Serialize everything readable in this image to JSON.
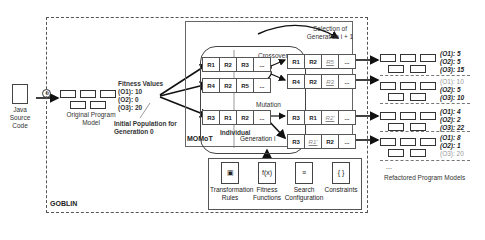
{
  "input": {
    "label": "Java Source Code",
    "icon": "document-icon"
  },
  "parser_icon": "gear-icon",
  "original_model": {
    "label": "Original Program Model"
  },
  "fitness": {
    "title": "Fitness Values",
    "values": [
      "(O1): 10",
      "(O2): 0",
      "(O3): 20"
    ]
  },
  "initial_population": "Initial Population for Generation 0",
  "containers": {
    "goblin": "GOBLIN",
    "momot": "MOMoT",
    "generation": "Generation i"
  },
  "operators": {
    "crossover": "Crossover",
    "mutation": "Mutation",
    "selection": "Selection of Generation i + 1"
  },
  "individual_label": "Individual",
  "parents": [
    [
      "R1",
      "R2",
      "R3",
      "..."
    ],
    [
      "R4",
      "R2",
      "R5",
      "..."
    ],
    [
      "R3",
      "R1",
      "R2",
      "..."
    ]
  ],
  "offspring": [
    [
      {
        "t": "R1"
      },
      {
        "t": "R2"
      },
      {
        "t": "R5",
        "m": true
      },
      {
        "t": "..."
      }
    ],
    [
      {
        "t": "R4"
      },
      {
        "t": "R2"
      },
      {
        "t": "R3",
        "m": true
      },
      {
        "t": "..."
      }
    ],
    [
      {
        "t": "R3"
      },
      {
        "t": "R1"
      },
      {
        "t": "R2'",
        "m": true
      },
      {
        "t": "..."
      }
    ],
    [
      {
        "t": "R3"
      },
      {
        "t": "R1'",
        "m": true
      },
      {
        "t": "R2"
      },
      {
        "t": "..."
      }
    ]
  ],
  "results": [
    {
      "o1": "(O1): 5",
      "o2": "(O2): 5",
      "o3": "(O3): 15"
    },
    {
      "o1": "(O1): 10",
      "o2": "(O2): 5",
      "o3": "(O3): 10"
    },
    {
      "o1": "(O1): 4",
      "o2": "(O2): 2",
      "o3": "(O3): 22"
    },
    {
      "o1": "(O1): 8",
      "o2": "(O2): 1",
      "o3": "(O3): 20"
    }
  ],
  "results_ellipsis": "...",
  "refactored_label": "Refactored Program Models",
  "inputs": [
    {
      "label": "Transformation Rules",
      "icon": "diagram-icon",
      "glyph": "▣"
    },
    {
      "label": "Fitness Functions",
      "icon": "function-icon",
      "glyph": "f(x)"
    },
    {
      "label": "Search Configuration",
      "icon": "config-icon",
      "glyph": "≡"
    },
    {
      "label": "Constraints",
      "icon": "braces-icon",
      "glyph": "{ }"
    }
  ]
}
